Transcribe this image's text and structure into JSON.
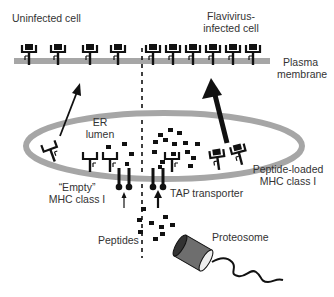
{
  "labels": {
    "uninfected_cell": "Uninfected cell",
    "infected_cell_line1": "Flavivirus-",
    "infected_cell_line2": "infected cell",
    "plasma_membrane_line1": "Plasma",
    "plasma_membrane_line2": "membrane",
    "er_lumen_line1": "ER",
    "er_lumen_line2": "lumen",
    "empty_mhc_line1": "“Empty”",
    "empty_mhc_line2": "MHC class I",
    "peptide_loaded_line1": "Peptide-loaded",
    "peptide_loaded_line2": "MHC class I",
    "tap_transporter": "TAP transporter",
    "peptides": "Peptides",
    "proteosome": "Proteosome"
  },
  "colors": {
    "membrane": "#a6a6a6",
    "ink": "#111111",
    "text": "#333333",
    "proteosome_body": "#6e6e6e"
  },
  "regions": [
    {
      "name": "Uninfected cell",
      "mhc_count_surface": 4,
      "arrow": "thin"
    },
    {
      "name": "Flavivirus-infected cell",
      "mhc_count_surface": 7,
      "arrow": "thick"
    }
  ]
}
